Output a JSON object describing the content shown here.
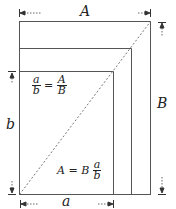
{
  "labels": {
    "top_width": "A",
    "right_height": "B",
    "left_height": "b",
    "bottom_width": "a"
  },
  "equations": {
    "ratio": {
      "lhs_num": "a",
      "lhs_den": "b",
      "eq": "=",
      "rhs_num": "A",
      "rhs_den": "B"
    },
    "area": {
      "lhs": "A",
      "eq": "=",
      "coef": "B",
      "frac_num": "a",
      "frac_den": "b"
    }
  },
  "colors": {
    "line": "#555555",
    "text": "#222222"
  }
}
